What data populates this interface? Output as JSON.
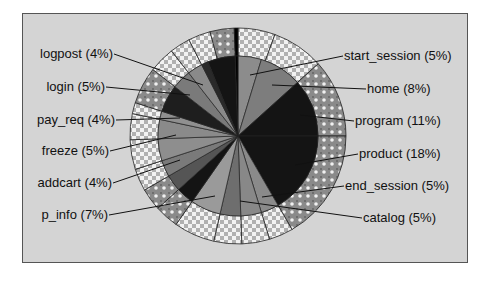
{
  "chart_data": {
    "type": "pie",
    "title": "",
    "variant": "nested pie (inner pie with outer ring of sub-segments)",
    "center": [
      238,
      136
    ],
    "inner_radius": 80,
    "outer_radius": 108,
    "legend_position": "none (leader-line labels)",
    "slices": [
      {
        "label": "start_session",
        "percent": 5,
        "display": "start_session (5%)",
        "side": "right"
      },
      {
        "label": "home",
        "percent": 8,
        "display": "home (8%)",
        "side": "right"
      },
      {
        "label": "program",
        "percent": 11,
        "display": "program (11%)",
        "side": "right"
      },
      {
        "label": "product",
        "percent": 18,
        "display": "product (18%)",
        "side": "right"
      },
      {
        "label": "end_session",
        "percent": 5,
        "display": "end_session (5%)",
        "side": "right"
      },
      {
        "label": "catalog",
        "percent": 5,
        "display": "catalog (5%)",
        "side": "right"
      },
      {
        "label": "p_info",
        "percent": 7,
        "display": "p_info (7%)",
        "side": "left"
      },
      {
        "label": "addcart",
        "percent": 4,
        "display": "addcart (4%)",
        "side": "left"
      },
      {
        "label": "freeze",
        "percent": 5,
        "display": "freeze (5%)",
        "side": "left"
      },
      {
        "label": "pay_req",
        "percent": 4,
        "display": "pay_req (4%)",
        "side": "left"
      },
      {
        "label": "login",
        "percent": 5,
        "display": "login (5%)",
        "side": "left"
      },
      {
        "label": "logpost",
        "percent": 4,
        "display": "logpost (4%)",
        "side": "left"
      }
    ],
    "labels_right": [
      {
        "text": "start_session (5%)",
        "x": 343,
        "y": 60,
        "anchor": [
          250,
          75
        ]
      },
      {
        "text": "home (8%)",
        "x": 366,
        "y": 93,
        "anchor": [
          272,
          85
        ]
      },
      {
        "text": "program (11%)",
        "x": 354,
        "y": 125,
        "anchor": [
          300,
          115
        ]
      },
      {
        "text": "product (18%)",
        "x": 358,
        "y": 158,
        "anchor": [
          295,
          165
        ]
      },
      {
        "text": "end_session (5%)",
        "x": 344,
        "y": 190,
        "anchor": [
          262,
          197
        ]
      },
      {
        "text": "catalog (5%)",
        "x": 362,
        "y": 222,
        "anchor": [
          240,
          201
        ]
      }
    ],
    "labels_left": [
      {
        "text": "logpost (4%)",
        "x": 114,
        "y": 58,
        "anchor": [
          203,
          85
        ]
      },
      {
        "text": "login (5%)",
        "x": 106,
        "y": 91,
        "anchor": [
          190,
          95
        ]
      },
      {
        "text": "pay_req (4%)",
        "x": 116,
        "y": 124,
        "anchor": [
          180,
          118
        ]
      },
      {
        "text": "freeze (5%)",
        "x": 110,
        "y": 155,
        "anchor": [
          176,
          135
        ]
      },
      {
        "text": "addcart (4%)",
        "x": 113,
        "y": 187,
        "anchor": [
          180,
          160
        ]
      },
      {
        "text": "p_info (7%)",
        "x": 109,
        "y": 219,
        "anchor": [
          215,
          196
        ]
      }
    ],
    "inner_wedges": [
      {
        "from": 0,
        "to": 17,
        "fill": "#8c8c8c"
      },
      {
        "from": 17,
        "to": 48,
        "fill": "#7d7d7d"
      },
      {
        "from": 48,
        "to": 90,
        "fill": "#141414"
      },
      {
        "from": 90,
        "to": 150,
        "fill": "#141414"
      },
      {
        "from": 150,
        "to": 163,
        "fill": "#8a8a8a"
      },
      {
        "from": 163,
        "to": 178,
        "fill": "#888888"
      },
      {
        "from": 178,
        "to": 193,
        "fill": "#6e6e6e"
      },
      {
        "from": 193,
        "to": 215,
        "fill": "#9a9a9a"
      },
      {
        "from": 215,
        "to": 228,
        "fill": "#141414"
      },
      {
        "from": 228,
        "to": 240,
        "fill": "#555555"
      },
      {
        "from": 240,
        "to": 252,
        "fill": "#7a7a7a"
      },
      {
        "from": 252,
        "to": 268,
        "fill": "#8e8e8e"
      },
      {
        "from": 268,
        "to": 282,
        "fill": "#8a8a8a"
      },
      {
        "from": 282,
        "to": 288,
        "fill": "#909090"
      },
      {
        "from": 288,
        "to": 308,
        "fill": "#1e1e1e"
      },
      {
        "from": 308,
        "to": 322,
        "fill": "#7a7a7a"
      },
      {
        "from": 322,
        "to": 333,
        "fill": "#8a8a8a"
      },
      {
        "from": 333,
        "to": 338,
        "fill": "#2a2a2a"
      },
      {
        "from": 338,
        "to": 358,
        "fill": "#141414"
      },
      {
        "from": 358,
        "to": 360,
        "fill": "#000000"
      }
    ],
    "outer_segments": [
      {
        "from": 0,
        "to": 20,
        "pattern": "light"
      },
      {
        "from": 20,
        "to": 48,
        "pattern": "light"
      },
      {
        "from": 48,
        "to": 90,
        "pattern": "dark"
      },
      {
        "from": 90,
        "to": 150,
        "pattern": "dark"
      },
      {
        "from": 150,
        "to": 163,
        "pattern": "light"
      },
      {
        "from": 163,
        "to": 178,
        "pattern": "light"
      },
      {
        "from": 178,
        "to": 193,
        "pattern": "light"
      },
      {
        "from": 193,
        "to": 215,
        "pattern": "light"
      },
      {
        "from": 215,
        "to": 228,
        "pattern": "dark"
      },
      {
        "from": 228,
        "to": 240,
        "pattern": "dark"
      },
      {
        "from": 240,
        "to": 252,
        "pattern": "light"
      },
      {
        "from": 252,
        "to": 268,
        "pattern": "light"
      },
      {
        "from": 268,
        "to": 282,
        "pattern": "light"
      },
      {
        "from": 282,
        "to": 288,
        "pattern": "light"
      },
      {
        "from": 288,
        "to": 308,
        "pattern": "dark"
      },
      {
        "from": 308,
        "to": 322,
        "pattern": "light"
      },
      {
        "from": 322,
        "to": 333,
        "pattern": "light"
      },
      {
        "from": 333,
        "to": 345,
        "pattern": "light"
      },
      {
        "from": 345,
        "to": 358,
        "pattern": "dark"
      },
      {
        "from": 358,
        "to": 360,
        "pattern": "black"
      }
    ],
    "colors": {
      "background": "#d4d4d4",
      "frame_border": "#555555",
      "leader_line": "#111111",
      "wedge_border": "#222222"
    }
  }
}
